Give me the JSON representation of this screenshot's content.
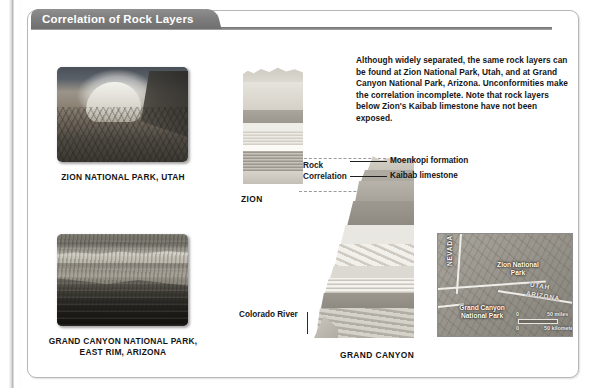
{
  "panel": {
    "title": "Correlation of Rock Layers"
  },
  "intro": {
    "text": "Although widely separated, the same rock layers can be found at Zion National Park, Utah, and at Grand Canyon National Park, Arizona. Unconformities make the correlation incomplete. Note that rock layers below Zion's Kaibab limestone have not been exposed."
  },
  "photos": [
    {
      "id": "zion",
      "caption": "ZION NATIONAL PARK, UTAH"
    },
    {
      "id": "grand-canyon",
      "caption": "GRAND CANYON NATIONAL PARK, EAST RIM, ARIZONA"
    }
  ],
  "diagrams": {
    "zion_label": "ZION",
    "grand_canyon_label": "GRAND CANYON",
    "correlation_label": "Rock\nCorrelation",
    "correlation_label_line1": "Rock",
    "correlation_label_line2": "Correlation",
    "colorado_river_label": "Colorado River"
  },
  "callouts": [
    {
      "label": "Moenkopi formation"
    },
    {
      "label": "Kaibab limestone"
    }
  ],
  "map": {
    "labels": {
      "nevada": "NEVADA",
      "utah": "UTAH",
      "arizona": "ARIZONA",
      "zion_park": "Zion National Park",
      "grand_canyon_park": "Grand Canyon National Park"
    },
    "scale": {
      "miles_start": "0",
      "miles_end": "50 miles",
      "km_start": "0",
      "km_end": "50 kilometers"
    }
  },
  "colors": {
    "title_bar": "#7e7e7e",
    "panel_border": "#b7b7b7",
    "text": "#161616",
    "leader_line": "#1f1f1f",
    "dashed_guide": "#9a9a9a"
  }
}
